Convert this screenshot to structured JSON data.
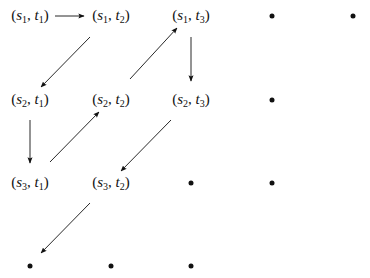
{
  "diagram": {
    "nodes": [
      {
        "id": "s1t1",
        "row": 1,
        "col": 1,
        "s": "1",
        "t": "1",
        "label": "(s1, t1)"
      },
      {
        "id": "s1t2",
        "row": 1,
        "col": 2,
        "s": "1",
        "t": "2",
        "label": "(s1, t2)"
      },
      {
        "id": "s1t3",
        "row": 1,
        "col": 3,
        "s": "1",
        "t": "3",
        "label": "(s1, t3)"
      },
      {
        "id": "r1c4",
        "row": 1,
        "col": 4,
        "dot": true
      },
      {
        "id": "r1c5",
        "row": 1,
        "col": 5,
        "dot": true
      },
      {
        "id": "s2t1",
        "row": 2,
        "col": 1,
        "s": "2",
        "t": "1",
        "label": "(s2, t1)"
      },
      {
        "id": "s2t2",
        "row": 2,
        "col": 2,
        "s": "2",
        "t": "2",
        "label": "(s2, t2)"
      },
      {
        "id": "s2t3",
        "row": 2,
        "col": 3,
        "s": "2",
        "t": "3",
        "label": "(s2, t3)"
      },
      {
        "id": "r2c4",
        "row": 2,
        "col": 4,
        "dot": true
      },
      {
        "id": "s3t1",
        "row": 3,
        "col": 1,
        "s": "3",
        "t": "1",
        "label": "(s3, t1)"
      },
      {
        "id": "s3t2",
        "row": 3,
        "col": 2,
        "s": "3",
        "t": "2",
        "label": "(s3, t2)"
      },
      {
        "id": "r3c3",
        "row": 3,
        "col": 3,
        "dot": true
      },
      {
        "id": "r3c4",
        "row": 3,
        "col": 4,
        "dot": true
      },
      {
        "id": "r4c1",
        "row": 4,
        "col": 1,
        "dot": true
      },
      {
        "id": "r4c2",
        "row": 4,
        "col": 2,
        "dot": true
      },
      {
        "id": "r4c3",
        "row": 4,
        "col": 3,
        "dot": true
      }
    ],
    "edges": [
      {
        "from": "s1t1",
        "to": "s1t2"
      },
      {
        "from": "s1t2",
        "to": "s2t1"
      },
      {
        "from": "s2t1",
        "to": "s3t1"
      },
      {
        "from": "s3t1",
        "to": "s2t2"
      },
      {
        "from": "s2t2",
        "to": "s1t3"
      },
      {
        "from": "s1t3",
        "to": "s2t3"
      },
      {
        "from": "s2t3",
        "to": "s3t2"
      },
      {
        "from": "s3t2",
        "to": "r4c1"
      }
    ],
    "symbols": {
      "s": "s",
      "t": "t"
    }
  }
}
